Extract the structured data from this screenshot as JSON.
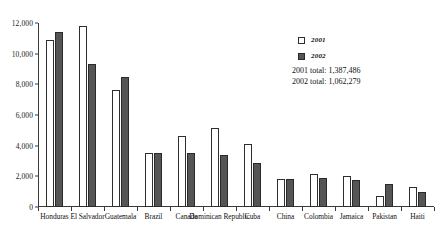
{
  "chart_data": {
    "type": "bar",
    "title": "",
    "xlabel": "",
    "ylabel": "",
    "ylim": [
      0,
      12000
    ],
    "ytick_labels": [
      "0",
      "2,000",
      "4,000",
      "6,000",
      "8,000",
      "10,000",
      "12,000"
    ],
    "ytick_values": [
      0,
      2000,
      4000,
      6000,
      8000,
      10000,
      12000
    ],
    "grid": false,
    "legend_position": "top-right",
    "categories": [
      "Honduras",
      "El Salvador",
      "Guatemala",
      "Brazil",
      "Canada",
      "Dominican Republic",
      "Cuba",
      "China",
      "Colombia",
      "Jamaica",
      "Pakistan",
      "Haiti"
    ],
    "series": [
      {
        "name": "2001",
        "color": "#ffffff",
        "values": [
          10900,
          11800,
          7600,
          3500,
          4600,
          5150,
          4100,
          1850,
          2150,
          2000,
          700,
          1300
        ]
      },
      {
        "name": "2002",
        "color": "#555555",
        "values": [
          11400,
          9350,
          8450,
          3500,
          3550,
          3400,
          2850,
          1850,
          1900,
          1750,
          1500,
          950
        ]
      }
    ],
    "annotations": [
      "2001 total:  1,387,486",
      "2002 total:  1,062,279"
    ]
  },
  "legend": {
    "items": [
      {
        "label": "2001"
      },
      {
        "label": "2002"
      }
    ]
  },
  "totals": {
    "line1": "2001 total:  1,387,486",
    "line2": "2002 total:  1,062,279"
  }
}
